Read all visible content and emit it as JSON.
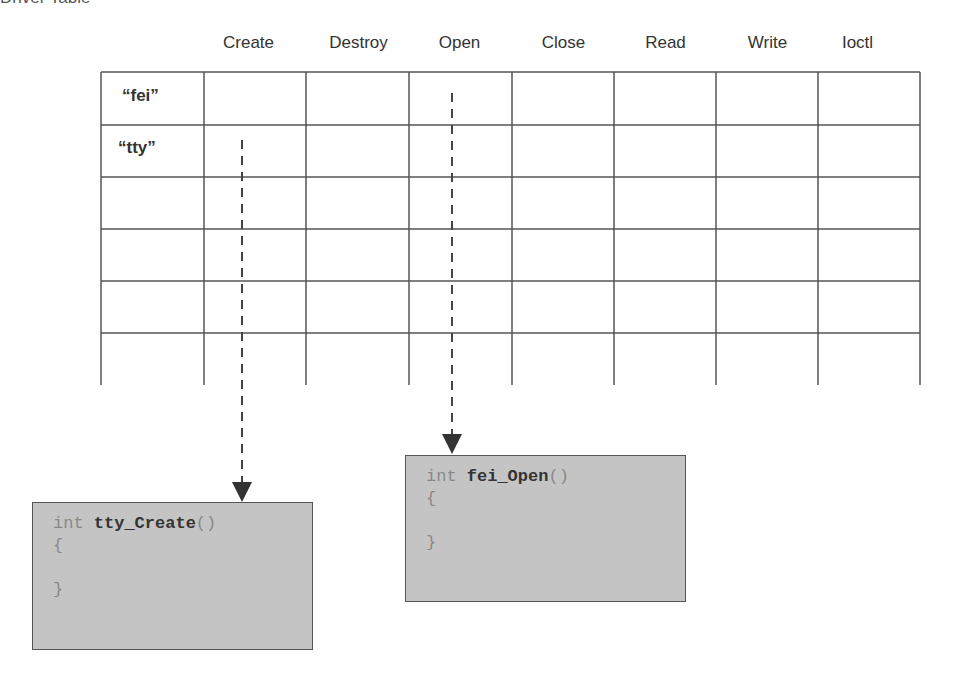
{
  "title": "Driver Table",
  "columns": [
    "Create",
    "Destroy",
    "Open",
    "Close",
    "Read",
    "Write",
    "Ioctl"
  ],
  "rows": [
    {
      "label": "“fei”"
    },
    {
      "label": "“tty”"
    },
    {
      "label": ""
    },
    {
      "label": ""
    },
    {
      "label": ""
    },
    {
      "label": ""
    }
  ],
  "code_boxes": [
    {
      "type_kw": "int",
      "func_name": "tty_Create",
      "parens": "()",
      "open_brace": "{",
      "close_brace": "}"
    },
    {
      "type_kw": "int",
      "func_name": "fei_Open",
      "parens": "()",
      "open_brace": "{",
      "close_brace": "}"
    }
  ],
  "arrows": [
    {
      "from": "tty.Create",
      "to": "tty_Create"
    },
    {
      "from": "fei.Open",
      "to": "fei_Open"
    }
  ]
}
